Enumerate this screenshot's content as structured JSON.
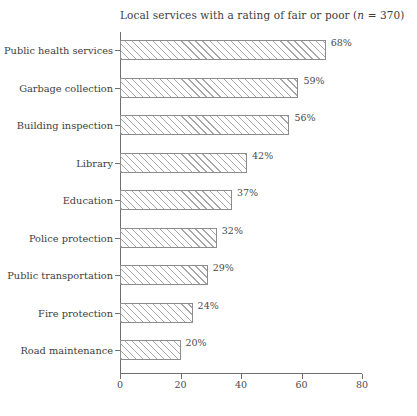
{
  "chart_data": {
    "type": "bar",
    "orientation": "horizontal",
    "title": "Local services with a rating of fair or poor (n = 370)",
    "title_prefix": "Local services with a rating of fair or poor (",
    "title_italic": "n",
    "title_suffix": " = 370)",
    "xlabel": "",
    "ylabel": "",
    "xlim": [
      0,
      80
    ],
    "xticks": [
      0,
      20,
      40,
      60,
      80
    ],
    "xtick_labels": [
      "0",
      "20",
      "40",
      "60",
      "80"
    ],
    "grid": false,
    "legend": false,
    "categories": [
      "Public health services",
      "Garbage collection",
      "Building inspection",
      "Library",
      "Education",
      "Police protection",
      "Public transportation",
      "Fire protection",
      "Road maintenance"
    ],
    "values": [
      68,
      59,
      56,
      42,
      37,
      32,
      29,
      24,
      20
    ],
    "value_labels": [
      "68%",
      "59%",
      "56%",
      "42%",
      "37%",
      "32%",
      "29%",
      "24%",
      "20%"
    ],
    "bar_style": {
      "fill": "#ffffff",
      "hatch": "diagonal-45",
      "hatch_color": "#a8a8a8",
      "edge_color": "#8c8c8c"
    },
    "axis_color": "#6f6f6f",
    "background": "#ffffff",
    "text_color": "#3d3d3d"
  }
}
